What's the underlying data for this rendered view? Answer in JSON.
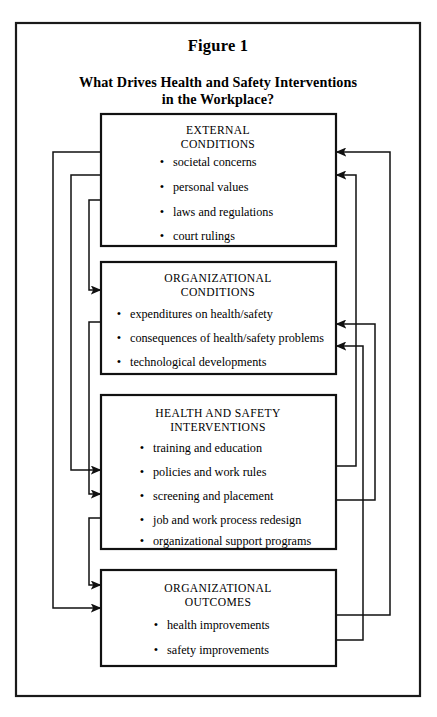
{
  "figure": {
    "label": "Figure 1",
    "title_line1": "What Drives Health and Safety Interventions",
    "title_line2": "in the Workplace?"
  },
  "nodes": [
    {
      "id": "external-conditions",
      "title_line1": "EXTERNAL",
      "title_line2": "CONDITIONS",
      "items": [
        "societal concerns",
        "personal values",
        "laws and regulations",
        "court rulings"
      ]
    },
    {
      "id": "organizational-conditions",
      "title_line1": "ORGANIZATIONAL",
      "title_line2": "CONDITIONS",
      "items": [
        "expenditures on health/safety",
        "consequences of health/safety problems",
        "technological developments"
      ]
    },
    {
      "id": "health-and-safety-interventions",
      "title_line1": "HEALTH AND SAFETY",
      "title_line2": "INTERVENTIONS",
      "items": [
        "training and education",
        "policies and work rules",
        "screening and placement",
        "job and work process redesign",
        "organizational support programs"
      ]
    },
    {
      "id": "organizational-outcomes",
      "title_line1": "ORGANIZATIONAL",
      "title_line2": "OUTCOMES",
      "items": [
        "health improvements",
        "safety improvements"
      ]
    }
  ],
  "bullet_glyph": "•",
  "colors": {
    "line": "#111111",
    "frame": "#1a1a1a",
    "background": "#ffffff",
    "text": "#000000"
  },
  "flows": [
    {
      "from": "external-conditions",
      "to": "organizational-conditions",
      "side": "left"
    },
    {
      "from": "external-conditions",
      "to": "health-and-safety-interventions",
      "side": "left"
    },
    {
      "from": "external-conditions",
      "to": "organizational-outcomes",
      "side": "left"
    },
    {
      "from": "organizational-conditions",
      "to": "health-and-safety-interventions",
      "side": "left"
    },
    {
      "from": "organizational-conditions",
      "to": "organizational-outcomes",
      "side": "left"
    },
    {
      "from": "health-and-safety-interventions",
      "to": "external-conditions",
      "side": "right"
    },
    {
      "from": "health-and-safety-interventions",
      "to": "organizational-conditions",
      "side": "right"
    },
    {
      "from": "organizational-outcomes",
      "to": "external-conditions",
      "side": "right"
    },
    {
      "from": "organizational-outcomes",
      "to": "organizational-conditions",
      "side": "right"
    }
  ]
}
